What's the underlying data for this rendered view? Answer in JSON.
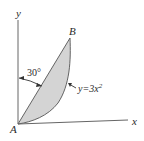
{
  "diagram": {
    "axes": {
      "x_label": "x",
      "y_label": "y"
    },
    "points": {
      "origin": "A",
      "top": "B"
    },
    "angle_label": "30°",
    "curve_label_prefix": "y=3x",
    "curve_label_exponent": "2",
    "colors": {
      "fill": "#d4d4d4",
      "line": "#555555",
      "text": "#2a2a2a"
    }
  }
}
